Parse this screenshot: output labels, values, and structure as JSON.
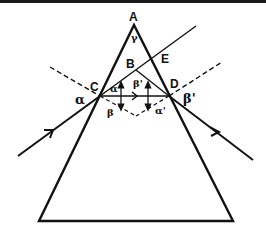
{
  "diagram": {
    "title": "",
    "colors": {
      "ink": "#111111",
      "background": "#ffffff",
      "top_border": "#1a1a1a"
    },
    "points": {
      "A": {
        "label": "A"
      },
      "B": {
        "label": "B"
      },
      "C": {
        "label": "C"
      },
      "D": {
        "label": "D"
      },
      "E": {
        "label": "E"
      }
    },
    "angles": {
      "apex": "γ",
      "incidence": "α",
      "refraction_in": "β",
      "alpha_inner": "α",
      "beta_prime_inner": "β'",
      "alpha_prime": "α'",
      "exit": "β'"
    },
    "elements": [
      "prism-outline",
      "incident-ray",
      "internal-ray",
      "emergent-ray",
      "normal-at-C",
      "normal-at-D",
      "extension-line-CBE",
      "line-BD"
    ]
  }
}
